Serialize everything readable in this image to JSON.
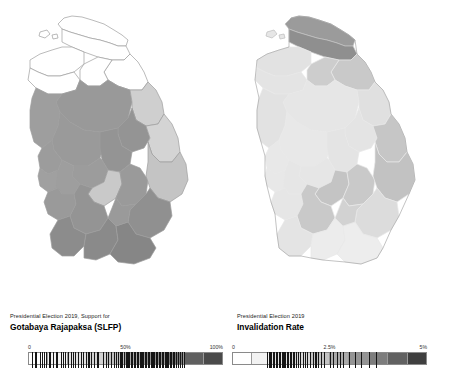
{
  "figure": {
    "background": "#ffffff",
    "panel_count": 2
  },
  "panels": [
    {
      "id": "support-gotabaya",
      "caption": {
        "subtitle": "Presidential Election 2019, Support for",
        "title": "Gotabaya Rajapaksa (SLFP)"
      },
      "legend": {
        "min_label": "0",
        "mid_label": "50%",
        "max_label": "100%",
        "steps": [
          "#ffffff",
          "#f2f2f2",
          "#e2e2e2",
          "#d2d2d2",
          "#bfbfbf",
          "#a8a8a8",
          "#8f8f8f",
          "#787878",
          "#5f5f5f",
          "#4a4a4a"
        ],
        "rug_values": [
          2.2,
          3.4,
          4.0,
          6.1,
          7.3,
          8.0,
          9.4,
          11.0,
          12.6,
          14.2,
          15.0,
          16.8,
          18.1,
          19.0,
          20.4,
          22.0,
          23.2,
          24.0,
          25.8,
          27.2,
          28.0,
          29.5,
          31.0,
          32.4,
          34.0,
          35.2,
          36.0,
          38.4,
          40.1,
          41.0,
          42.6,
          44.0,
          45.2,
          46.0,
          47.4,
          48.2,
          49.0,
          50.2,
          51.0,
          51.8,
          52.6,
          53.4,
          54.2,
          55.0,
          55.8,
          56.6,
          57.4,
          58.2,
          59.0,
          59.8,
          60.6,
          61.4,
          62.2,
          63.0,
          63.8,
          64.6,
          65.4,
          66.2,
          67.0,
          67.8,
          68.6,
          69.4,
          70.2,
          71.0,
          71.8,
          72.6,
          73.4,
          74.2,
          75.0,
          76.0,
          77.0,
          78.0,
          79.0,
          80.0
        ]
      }
    },
    {
      "id": "invalidation-rate",
      "caption": {
        "subtitle": "Presidential Election 2019",
        "title": "Invalidation Rate"
      },
      "legend": {
        "min_label": "0",
        "mid_label": "2.5%",
        "max_label": "5%",
        "steps": [
          "#ffffff",
          "#f2f2f2",
          "#e4e4e4",
          "#d6d6d6",
          "#c4c4c4",
          "#ababab",
          "#949494",
          "#7d7d7d",
          "#616161",
          "#3f3f3f"
        ],
        "rug_values": [
          18.0,
          19.2,
          20.0,
          20.8,
          21.6,
          22.4,
          23.2,
          24.0,
          24.8,
          25.6,
          26.4,
          27.2,
          28.0,
          28.8,
          29.6,
          30.4,
          31.2,
          32.0,
          33.0,
          34.0,
          35.0,
          36.2,
          37.4,
          38.6,
          40.0,
          41.4,
          42.8,
          44.2,
          45.6,
          47.0,
          50.0,
          52.0,
          54.0,
          55.5,
          57.0,
          60.0,
          63.0,
          66.0,
          70.0,
          74.0
        ]
      }
    }
  ],
  "chart_data": {
    "type": "choropleth-map-pair",
    "region": "Sri Lanka",
    "unit": "district",
    "maps": [
      {
        "name": "Support for Gotabaya Rajapaksa (SLFP)",
        "subtitle": "Presidential Election 2019, Support for",
        "value_unit": "percent",
        "scale_min": 0,
        "scale_mid": 50,
        "scale_max": 100,
        "scale_labels": [
          "0",
          "50%",
          "100%"
        ],
        "colormap": "white-to-dark-gray (greys, 10 discrete steps)",
        "districts": [
          {
            "name": "Jaffna",
            "value": 3
          },
          {
            "name": "Kilinochchi",
            "value": 4
          },
          {
            "name": "Mannar",
            "value": 6
          },
          {
            "name": "Mullaitivu",
            "value": 8
          },
          {
            "name": "Vavuniya",
            "value": 16
          },
          {
            "name": "Batticaloa",
            "value": 24
          },
          {
            "name": "Trincomalee",
            "value": 38
          },
          {
            "name": "Ampara",
            "value": 43
          },
          {
            "name": "Nuwara Eliya",
            "value": 40
          },
          {
            "name": "Puttalam",
            "value": 59
          },
          {
            "name": "Anuradhapura",
            "value": 68
          },
          {
            "name": "Polonnaruwa",
            "value": 69
          },
          {
            "name": "Kurunegala",
            "value": 66
          },
          {
            "name": "Badulla",
            "value": 58
          },
          {
            "name": "Monaragala",
            "value": 70
          },
          {
            "name": "Kandy",
            "value": 56
          },
          {
            "name": "Matale",
            "value": 62
          },
          {
            "name": "Kegalle",
            "value": 58
          },
          {
            "name": "Ratnapura",
            "value": 63
          },
          {
            "name": "Colombo",
            "value": 56
          },
          {
            "name": "Gampaha",
            "value": 61
          },
          {
            "name": "Kalutara",
            "value": 62
          },
          {
            "name": "Galle",
            "value": 67
          },
          {
            "name": "Matara",
            "value": 70
          },
          {
            "name": "Hambantota",
            "value": 72
          }
        ]
      },
      {
        "name": "Invalidation Rate",
        "subtitle": "Presidential Election 2019",
        "value_unit": "percent",
        "scale_min": 0,
        "scale_mid": 2.5,
        "scale_max": 5,
        "scale_labels": [
          "0",
          "2.5%",
          "5%"
        ],
        "colormap": "white-to-dark-gray (greys, 10 discrete steps)",
        "districts": [
          {
            "name": "Jaffna",
            "value": 4.0
          },
          {
            "name": "Kilinochchi",
            "value": 2.6
          },
          {
            "name": "Mannar",
            "value": 1.6
          },
          {
            "name": "Mullaitivu",
            "value": 2.1
          },
          {
            "name": "Vavuniya",
            "value": 1.6
          },
          {
            "name": "Batticaloa",
            "value": 2.2
          },
          {
            "name": "Trincomalee",
            "value": 1.6
          },
          {
            "name": "Ampara",
            "value": 2.3
          },
          {
            "name": "Nuwara Eliya",
            "value": 2.1
          },
          {
            "name": "Puttalam",
            "value": 1.3
          },
          {
            "name": "Anuradhapura",
            "value": 1.1
          },
          {
            "name": "Polonnaruwa",
            "value": 1.2
          },
          {
            "name": "Kurunegala",
            "value": 1.1
          },
          {
            "name": "Badulla",
            "value": 2.0
          },
          {
            "name": "Monaragala",
            "value": 1.5
          },
          {
            "name": "Kandy",
            "value": 1.2
          },
          {
            "name": "Matale",
            "value": 1.3
          },
          {
            "name": "Kegalle",
            "value": 1.2
          },
          {
            "name": "Ratnapura",
            "value": 2.1
          },
          {
            "name": "Colombo",
            "value": 1.1
          },
          {
            "name": "Gampaha",
            "value": 1.1
          },
          {
            "name": "Kalutara",
            "value": 1.2
          },
          {
            "name": "Galle",
            "value": 1.2
          },
          {
            "name": "Matara",
            "value": 1.1
          },
          {
            "name": "Hambantota",
            "value": 1.0
          }
        ]
      }
    ]
  }
}
